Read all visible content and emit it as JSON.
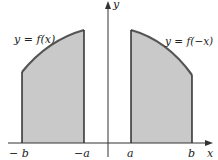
{
  "diagram": {
    "title": "",
    "axes": {
      "x_label": "x",
      "y_label": "y"
    },
    "ticks": {
      "neg_b": "− b",
      "neg_a": "−a",
      "a": "a",
      "b": "b"
    },
    "curves": {
      "left": {
        "label": "y = f(x)"
      },
      "right": {
        "label": "y = f(−x)"
      }
    },
    "colors": {
      "fill": "#c9c9c9",
      "curve": "#555555",
      "edges": "#222222",
      "axes": "#333333"
    }
  }
}
